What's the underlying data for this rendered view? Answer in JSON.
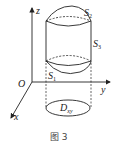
{
  "figure": {
    "caption": "图 3",
    "axes": {
      "z": "z",
      "y": "y",
      "x": "x",
      "origin": "O"
    },
    "surfaces": {
      "s1": {
        "letter": "S",
        "sub": "1"
      },
      "s2": {
        "letter": "S",
        "sub": "2"
      },
      "s3": {
        "letter": "S",
        "sub": "3"
      }
    },
    "region": {
      "letter": "D",
      "sub": "xy"
    },
    "colors": {
      "stroke": "#222222",
      "text": "#222222"
    }
  }
}
